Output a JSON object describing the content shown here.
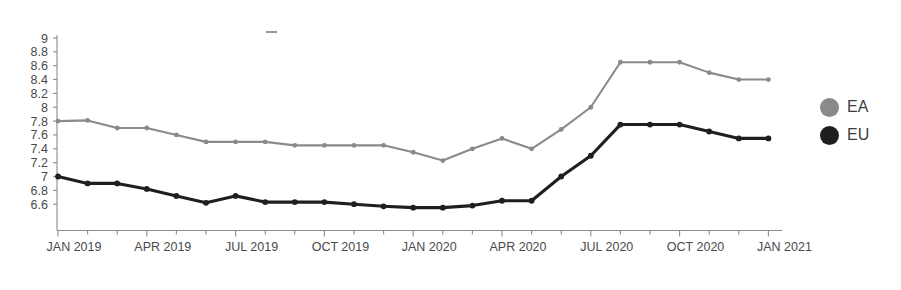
{
  "chart_data": {
    "type": "line",
    "title": "",
    "subtitle": "",
    "xlabel": "",
    "ylabel": "",
    "grid": false,
    "legend_position": "right",
    "ylim": [
      6.5,
      9.0
    ],
    "ytick_labels": [
      "9",
      "8.8",
      "8.6",
      "8.4",
      "8.2",
      "8",
      "7.8",
      "7.6",
      "7.4",
      "7.2",
      "7",
      "6.8",
      "6.6"
    ],
    "ytick_values": [
      9,
      8.8,
      8.6,
      8.4,
      8.2,
      8,
      7.8,
      7.6,
      7.4,
      7.2,
      7,
      6.8,
      6.6
    ],
    "xtick_labels": [
      "JAN 2019",
      "APR 2019",
      "JUL 2019",
      "OCT 2019",
      "JAN 2020",
      "APR 2020",
      "JUL 2020",
      "OCT 2020",
      "JAN 2021"
    ],
    "x": [
      "JAN 2019",
      "FEB 2019",
      "MAR 2019",
      "APR 2019",
      "MAY 2019",
      "JUN 2019",
      "JUL 2019",
      "AUG 2019",
      "SEP 2019",
      "OCT 2019",
      "NOV 2019",
      "DEC 2019",
      "JAN 2020",
      "FEB 2020",
      "MAR 2020",
      "APR 2020",
      "MAY 2020",
      "JUN 2020",
      "JUL 2020",
      "AUG 2020",
      "SEP 2020",
      "OCT 2020",
      "NOV 2020",
      "DEC 2020",
      "JAN 2021"
    ],
    "series": [
      {
        "name": "EA",
        "color": "#8a8a8a",
        "values": [
          7.8,
          7.81,
          7.7,
          7.7,
          7.6,
          7.5,
          7.5,
          7.5,
          7.45,
          7.45,
          7.45,
          7.45,
          7.35,
          7.23,
          7.4,
          7.55,
          7.4,
          7.68,
          8.0,
          8.65,
          8.65,
          8.65,
          8.5,
          8.4,
          8.4
        ]
      },
      {
        "name": "EU",
        "color": "#1f1f1f",
        "values": [
          7.0,
          6.9,
          6.9,
          6.82,
          6.72,
          6.62,
          6.72,
          6.63,
          6.63,
          6.63,
          6.6,
          6.57,
          6.55,
          6.55,
          6.58,
          6.65,
          6.65,
          7.0,
          7.3,
          7.75,
          7.75,
          7.75,
          7.65,
          7.55,
          7.55
        ]
      }
    ]
  },
  "legend": {
    "items": [
      {
        "label": "EA",
        "color": "#8a8a8a"
      },
      {
        "label": "EU",
        "color": "#1f1f1f"
      }
    ]
  }
}
